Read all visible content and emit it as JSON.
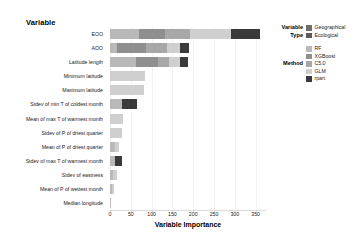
{
  "chart_data": {
    "type": "bar",
    "orientation": "horizontal",
    "stacked": true,
    "title": "",
    "xlabel": "Variable Importance",
    "ylabel": "Variable",
    "xlim": [
      0,
      375
    ],
    "grid": false,
    "legend_position": "right",
    "xticks": [
      0,
      50,
      100,
      150,
      200,
      250,
      300,
      350
    ],
    "categories": [
      "EOO",
      "AOO",
      "Latitude length",
      "Minimum latitude",
      "Maximum latitude",
      "Stdev of min T of coldest month",
      "Mean of max T of warmest month",
      "Stdev of P of driest quarter",
      "Mean of P of driest quarter",
      "Stdev of max T of warmest month",
      "Stdev of eastness",
      "Mean of P of wettest month",
      "Median longitude"
    ],
    "category_types": [
      "Geographical",
      "Geographical",
      "Geographical",
      "Geographical",
      "Geographical",
      "Ecological",
      "Ecological",
      "Ecological",
      "Ecological",
      "Ecological",
      "Ecological",
      "Ecological",
      "Geographical"
    ],
    "series": [
      {
        "name": "RF",
        "values": [
          70,
          18,
          62,
          0,
          0,
          30,
          0,
          0,
          12,
          12,
          8,
          4,
          3
        ]
      },
      {
        "name": "XGBoost",
        "values": [
          62,
          68,
          54,
          0,
          0,
          0,
          0,
          0,
          0,
          0,
          0,
          0,
          0
        ]
      },
      {
        "name": "C5.0",
        "values": [
          60,
          52,
          26,
          0,
          0,
          0,
          0,
          0,
          0,
          0,
          0,
          0,
          0
        ]
      },
      {
        "name": "GLM",
        "values": [
          98,
          30,
          26,
          84,
          82,
          0,
          32,
          28,
          10,
          0,
          10,
          6,
          0
        ]
      },
      {
        "name": "rpart",
        "values": [
          70,
          22,
          20,
          0,
          0,
          34,
          0,
          0,
          0,
          16,
          0,
          0,
          0
        ]
      }
    ],
    "totals": [
      360,
      190,
      188,
      84,
      82,
      64,
      32,
      28,
      22,
      28,
      18,
      10,
      3
    ]
  },
  "legend": {
    "variable_type": {
      "title_line1": "Variable",
      "title_line2": "Type",
      "items": [
        {
          "label": "Geographical",
          "color": "#6e6e6e"
        },
        {
          "label": "Ecological",
          "color": "#5a5a5a"
        }
      ]
    },
    "method": {
      "title": "Method",
      "items": [
        {
          "label": "RF",
          "color": "#b9b9b9"
        },
        {
          "label": "XGBoost",
          "color": "#8f8f8f"
        },
        {
          "label": "C5.0",
          "color": "#a8a8a8"
        },
        {
          "label": "GLM",
          "color": "#cfcfcf"
        },
        {
          "label": "rpart",
          "color": "#3a3a3a"
        }
      ]
    }
  },
  "colors": {
    "RF": "#b9b9b9",
    "XGBoost": "#8f8f8f",
    "C5.0": "#a8a8a8",
    "GLM": "#cfcfcf",
    "rpart": "#3a3a3a",
    "axis": "#d9d9d9",
    "text": "#1a1a1a",
    "background": "#ffffff"
  }
}
